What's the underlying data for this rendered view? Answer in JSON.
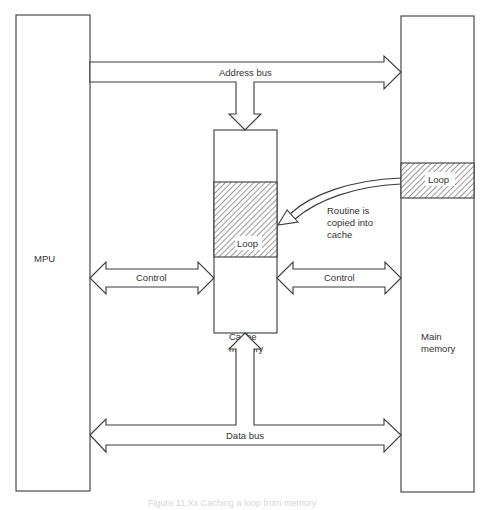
{
  "diagram": {
    "blocks": {
      "mpu": {
        "label": "MPU"
      },
      "cache": {
        "label_line1": "Cache",
        "label_line2": "memory",
        "loop_label": "Loop"
      },
      "main": {
        "label_line1": "Main",
        "label_line2": "memory",
        "loop_label": "Loop"
      }
    },
    "buses": {
      "address": "Address bus",
      "control_left": "Control",
      "control_right": "Control",
      "data": "Data bus"
    },
    "annotation": {
      "line1": "Routine is",
      "line2": "copied into",
      "line3": "cache"
    },
    "caption": "Figure 11.Xx  Caching a loop from memory"
  },
  "colors": {
    "stroke": "#3a3a3a",
    "text": "#333333",
    "hatch": "#555555",
    "caption": "#d6d6d6"
  }
}
